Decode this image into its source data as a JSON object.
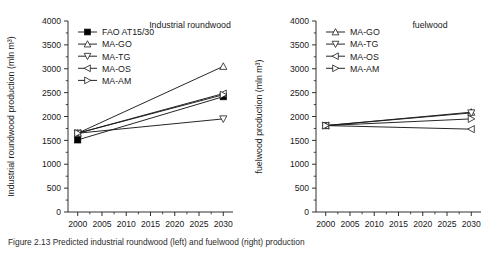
{
  "figure": {
    "caption": "Figure 2.13  Predicted industrial roundwood (left) and fuelwood (right) production"
  },
  "chart_data": [
    {
      "type": "line",
      "title": "Industrial roundwood",
      "xlabel": "",
      "ylabel": "Industrial roundwood production (mln m³)",
      "x": [
        2000,
        2030
      ],
      "xlim": [
        1998,
        2032
      ],
      "ylim": [
        0,
        4000
      ],
      "xticks": [
        2000,
        2005,
        2010,
        2015,
        2020,
        2025,
        2030
      ],
      "yticks": [
        0,
        500,
        1000,
        1500,
        2000,
        2500,
        3000,
        3500,
        4000
      ],
      "grid": false,
      "legend_position": "upper-left",
      "series": [
        {
          "name": "FAO AT15/30",
          "marker": "filled-square",
          "values": [
            1510,
            2415
          ]
        },
        {
          "name": "MA-GO",
          "marker": "triangle-up",
          "values": [
            1650,
            3050
          ]
        },
        {
          "name": "MA-TG",
          "marker": "triangle-down",
          "values": [
            1650,
            1950
          ]
        },
        {
          "name": "MA-OS",
          "marker": "triangle-left",
          "values": [
            1650,
            2480
          ]
        },
        {
          "name": "MA-AM",
          "marker": "triangle-right",
          "values": [
            1650,
            2455
          ]
        }
      ]
    },
    {
      "type": "line",
      "title": "fuelwood",
      "xlabel": "",
      "ylabel": "fuelwood production (mln m³)",
      "x": [
        2000,
        2030
      ],
      "xlim": [
        1998,
        2032
      ],
      "ylim": [
        0,
        4000
      ],
      "xticks": [
        2000,
        2005,
        2010,
        2015,
        2020,
        2025,
        2030
      ],
      "yticks": [
        0,
        500,
        1000,
        1500,
        2000,
        2500,
        3000,
        3500,
        4000
      ],
      "grid": false,
      "legend_position": "upper-left",
      "series": [
        {
          "name": "MA-GO",
          "marker": "triangle-up",
          "values": [
            1810,
            2090
          ]
        },
        {
          "name": "MA-TG",
          "marker": "triangle-down",
          "values": [
            1810,
            2075
          ]
        },
        {
          "name": "MA-OS",
          "marker": "triangle-left",
          "values": [
            1810,
            1735
          ]
        },
        {
          "name": "MA-AM",
          "marker": "triangle-right",
          "values": [
            1810,
            1950
          ]
        }
      ]
    }
  ],
  "axis_titles": {
    "left_y": "Industrial roundwood production (mln m³)",
    "right_y": "fuelwood production (mln m³)"
  },
  "panel_titles": {
    "left": "Industrial roundwood",
    "right": "fuelwood"
  }
}
